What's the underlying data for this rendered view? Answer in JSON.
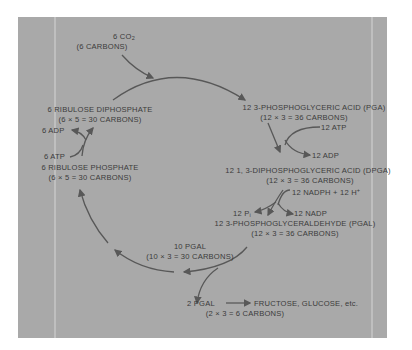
{
  "diagram": {
    "background_color": "#a9a9a9",
    "text_color": "#3b3b3b",
    "arrow_color": "#585858",
    "nodes": {
      "co2": {
        "line1_prefix": "6 CO",
        "line1_sub": "2",
        "line2": "(6 CARBONS)"
      },
      "pga": {
        "line1": "12  3-PHOSPHOGLYCERIC ACID (PGA)",
        "line2": "(12 × 3 = 36 CARBONS)"
      },
      "dpga": {
        "line1": "12  1, 3-DIPHOSPHOGLYCERIC ACID (DPGA)",
        "line2": "(12 × 3 = 36 CARBONS)"
      },
      "pgal": {
        "line1": "12  3-PHOSPHOGLYCERALDEHYDE (PGAL)",
        "line2": "(12 × 3 = 36 CARBONS)"
      },
      "pgal10": {
        "line1": "10 PGAL",
        "line2": "(10 × 3 = 30 CARBONS)"
      },
      "pgal2": {
        "line1": "2 PGAL",
        "line2": "(2 × 3 = 6 CARBONS)"
      },
      "products": {
        "label": "FRUCTOSE, GLUCOSE, etc."
      },
      "rp": {
        "line1": "6 RIBULOSE PHOSPHATE",
        "line2": "(6 × 5 = 30 CARBONS)"
      },
      "rdp": {
        "line1": "6 RIBULOSE DIPHOSPHATE",
        "line2": "(6 × 5 = 30 CARBONS)"
      }
    },
    "cofactors": {
      "atp12": "12 ATP",
      "adp12": "12 ADP",
      "nadph": {
        "prefix": "12 NADPH + 12 H",
        "sup": "+"
      },
      "pi": {
        "prefix": "12 P",
        "sub": "i"
      },
      "nadp": "12 NADP",
      "adp6": "6 ADP",
      "atp6": "6 ATP"
    }
  }
}
